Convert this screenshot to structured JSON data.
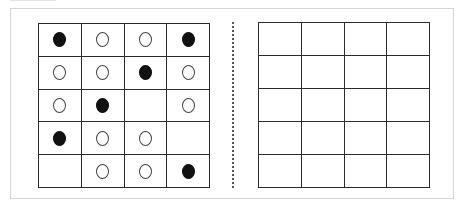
{
  "figure": {
    "colors": {
      "grid_line": "#2b2b2b",
      "filled_circle": "#111111",
      "empty_circle_outline": "#444444",
      "frame_border": "#d6d6d6",
      "divider": "#555555"
    },
    "left_grid": {
      "rows": 5,
      "cols": 4,
      "cells": [
        [
          "filled",
          "empty",
          "empty",
          "filled"
        ],
        [
          "empty",
          "empty",
          "filled",
          "empty"
        ],
        [
          "empty",
          "filled",
          "none",
          "empty"
        ],
        [
          "filled",
          "empty",
          "empty",
          "none"
        ],
        [
          "none",
          "empty",
          "empty",
          "filled"
        ]
      ]
    },
    "right_grid": {
      "rows": 5,
      "cols": 4,
      "cells": [
        [
          "none",
          "none",
          "none",
          "none"
        ],
        [
          "none",
          "none",
          "none",
          "none"
        ],
        [
          "none",
          "none",
          "none",
          "none"
        ],
        [
          "none",
          "none",
          "none",
          "none"
        ],
        [
          "none",
          "none",
          "none",
          "none"
        ]
      ]
    }
  }
}
